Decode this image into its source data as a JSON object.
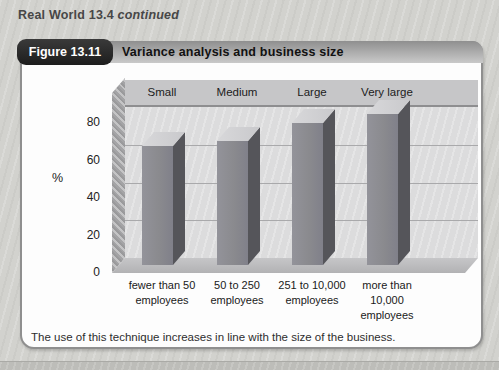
{
  "kicker": {
    "title": "Real World 13.4",
    "suffix": "continued"
  },
  "figure": {
    "badge_label": "Figure 13.11",
    "title": "Variance analysis and business size",
    "caption": "The use of this technique increases in line with the size of the business."
  },
  "chart_data": {
    "type": "bar",
    "variant": "3d-column",
    "title": "Variance analysis and business size",
    "group_labels": [
      "Small",
      "Medium",
      "Large",
      "Very large"
    ],
    "categories": [
      "fewer than 50 employees",
      "50 to 250 employees",
      "251 to 10,000 employees",
      "more than 10,000 employees"
    ],
    "values": [
      66,
      69,
      79,
      84
    ],
    "ylabel": "%",
    "yticks": [
      0,
      20,
      40,
      60,
      80
    ],
    "ylim": [
      0,
      88
    ],
    "grid": true,
    "legend": "none"
  },
  "colors": {
    "page_bg": "#d2d2ce",
    "badge_text": "#ffffff",
    "band_from": "#8f8f8f",
    "band_to": "#c9c9c9",
    "title": "#111111",
    "box_bg": "#fdfdfd",
    "box_border": "#8f8f8f",
    "wall": "#dcdcdd",
    "cat_band": "#c6c6c8",
    "grid": "#a9a9ab",
    "sidewall": "#a4a4a6",
    "floor": "#c6c6c8",
    "bar_front": "#8a8a8e",
    "bar_side": "#55555a",
    "bar_top": "#d8d8da",
    "caption": "#2e2e2e",
    "strip": "#bdbdb9"
  }
}
